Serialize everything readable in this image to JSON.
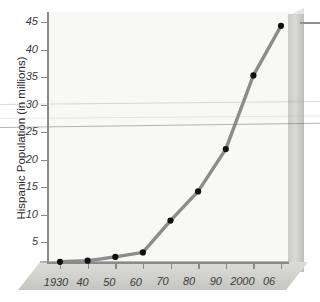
{
  "chart_data": {
    "type": "line",
    "title": "",
    "xlabel": "",
    "ylabel": "Hispanic Population (in millions)",
    "categories": [
      "1930",
      "40",
      "50",
      "60",
      "70",
      "80",
      "90",
      "2000",
      "06"
    ],
    "x": [
      1930,
      1940,
      1950,
      1960,
      1970,
      1980,
      1990,
      2000,
      2006
    ],
    "values": [
      1.4,
      1.6,
      2.3,
      3.1,
      8.9,
      14.2,
      21.9,
      35.3,
      44.3
    ],
    "series": [
      {
        "name": "Hispanic Population",
        "values": [
          1.4,
          1.6,
          2.3,
          3.1,
          8.9,
          14.2,
          21.9,
          35.3,
          44.3
        ]
      }
    ],
    "ylim": [
      0,
      46
    ],
    "yticks": [
      5,
      10,
      15,
      20,
      25,
      30,
      35,
      40,
      45
    ],
    "ytick_labels": [
      "5",
      "10",
      "15",
      "20",
      "25",
      "30",
      "35",
      "40",
      "45"
    ],
    "xtick_labels": [
      "1930",
      "40",
      "50",
      "60",
      "70",
      "80",
      "90",
      "2000",
      "06"
    ],
    "grid": false,
    "legend": "none",
    "marker": "filled-circle",
    "line_color": "#8c8c8c",
    "marker_color": "#111111",
    "plot_background": "#f8f8f6",
    "axis_color": "#8a8a88",
    "panel_3d_color": "#d2d2cf"
  },
  "axis": {
    "y_title": "Hispanic Population (in millions)"
  }
}
